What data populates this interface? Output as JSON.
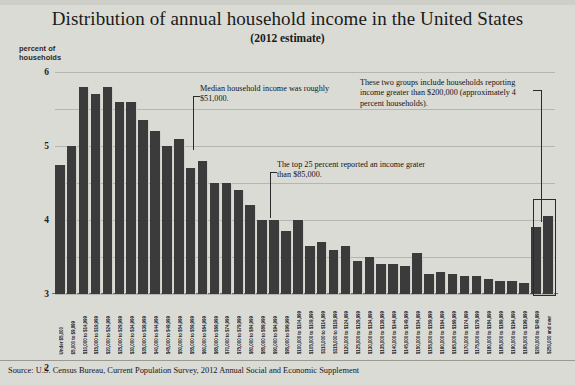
{
  "header": {
    "title": "Distribution of annual household income in the United States",
    "subtitle": "(2012 estimate)",
    "y_axis_caption": "percent of\nhouseholds"
  },
  "annotations": {
    "median": "Median household income was roughly $51,000.",
    "top25": "The top 25 percent reported an income grater than $85,000.",
    "two_groups": "These two groups include households reporting income greater than $200,000 (approximately 4 percent households)."
  },
  "source": "Source: U.S. Census Bureau, Current Population Survey, 2012 Annual Social and Economic Supplement",
  "colors": {
    "background": "#dbdbd6",
    "bar": "#3b3b3b",
    "gridline": "#b6b6b0",
    "text": "#1a1a1a"
  },
  "chart_data": {
    "type": "bar",
    "title": "Distribution of annual household income in the United States",
    "subtitle": "(2012 estimate)",
    "xlabel": "",
    "ylabel": "percent of households",
    "ylim": [
      0,
      6
    ],
    "yticks": [
      0,
      1,
      2,
      3,
      4,
      5,
      6
    ],
    "grid": true,
    "legend": "none",
    "categories": [
      "Under $5,000",
      "$5,000 to $9,999",
      "$10,000 to $14,999",
      "$15,000 to $19,999",
      "$20,000 to $24,999",
      "$25,000 to $29,999",
      "$30,000 to $34,999",
      "$35,000 to $39,999",
      "$40,000 to $44,999",
      "$45,000 to $49,999",
      "$50,000 to $54,999",
      "$55,000 to $59,999",
      "$60,000 to $64,999",
      "$65,000 to $69,999",
      "$70,000 to $74,999",
      "$75,000 to $79,999",
      "$80,000 to $84,999",
      "$85,000 to $89,999",
      "$90,000 to $94,999",
      "$95,000 to $99,999",
      "$100,000 to $104,999",
      "$105,000 to $109,999",
      "$110,000 to $114,999",
      "$115,000 to $119,999",
      "$120,000 to $124,999",
      "$125,000 to $129,999",
      "$130,000 to $134,999",
      "$135,000 to $139,999",
      "$140,000 to $144,999",
      "$145,000 to $149,999",
      "$150,000 to $154,999",
      "$155,000 to $159,999",
      "$160,000 to $164,999",
      "$165,000 to $169,999",
      "$170,000 to $174,999",
      "$175,000 to $179,999",
      "$180,000 to $184,999",
      "$185,000 to $189,999",
      "$190,000 to $194,999",
      "$195,000 to $199,999",
      "$200,000 to $249,999",
      "$250,000 and over"
    ],
    "values": [
      3.5,
      4.0,
      5.6,
      5.4,
      5.6,
      5.2,
      5.2,
      4.7,
      4.4,
      4.0,
      4.2,
      3.4,
      3.6,
      3.0,
      3.0,
      2.8,
      2.4,
      2.0,
      2.0,
      1.7,
      2.0,
      1.3,
      1.4,
      1.2,
      1.3,
      0.9,
      1.0,
      0.8,
      0.8,
      0.75,
      1.1,
      0.55,
      0.6,
      0.55,
      0.5,
      0.5,
      0.4,
      0.35,
      0.35,
      0.3,
      1.8,
      2.1
    ]
  }
}
